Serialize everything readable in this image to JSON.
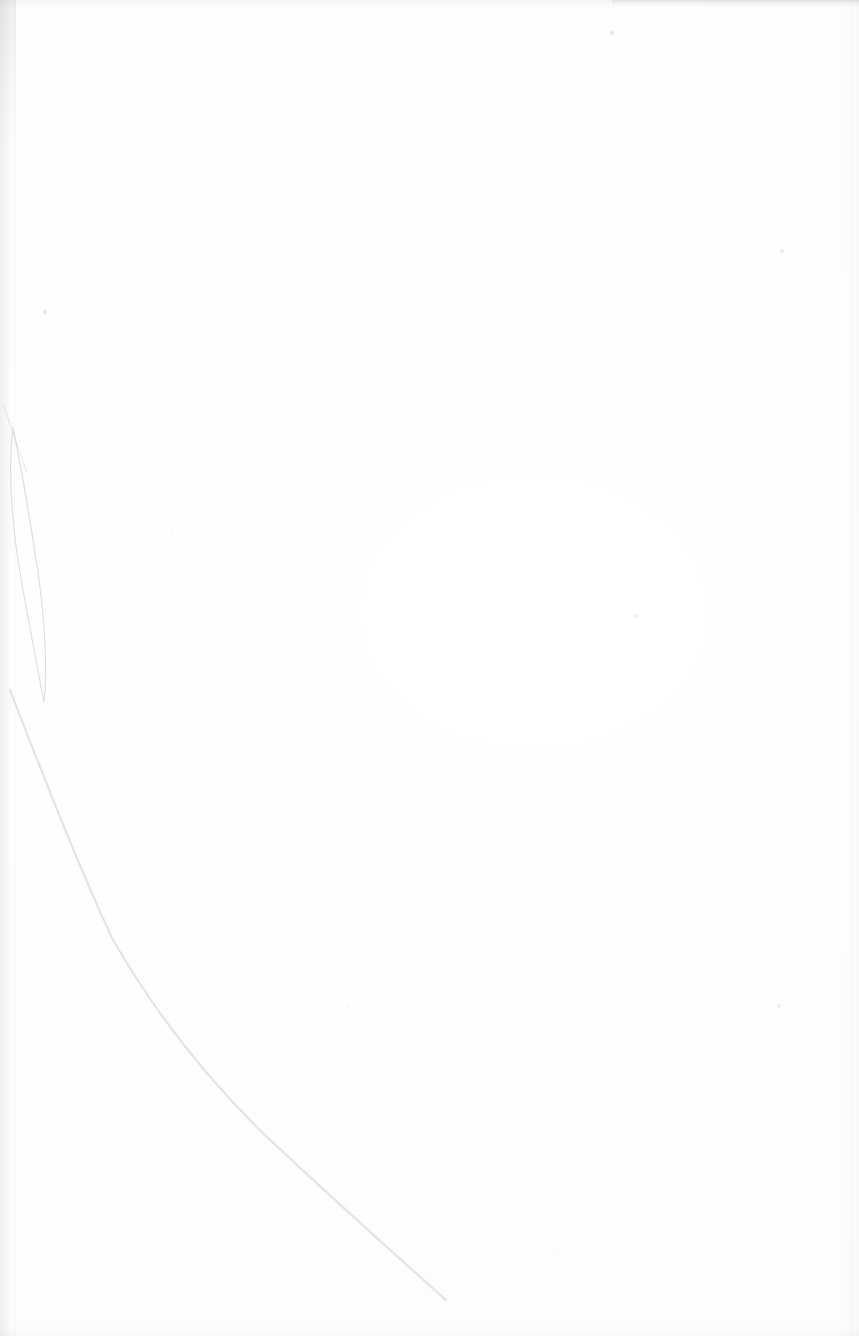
{
  "page": {
    "kind": "scanned-document-page",
    "orientation": "portrait",
    "width_px": 859,
    "height_px": 1336,
    "visible_text": "",
    "text_content_present": false,
    "paper_color": "#ffffff",
    "background_tone": "#fefefe",
    "ink_color": "#1a1a1a"
  },
  "artifacts": {
    "gutter_shadow": {
      "name": "left binding shadow",
      "x": 0,
      "y": 0,
      "width": 15,
      "height": 1336,
      "color": "#7c8086",
      "opacity": 0.115
    },
    "gutter_rule": {
      "name": "faint vertical rule beside gutter",
      "x": 14,
      "color": "#969aa0",
      "opacity": 0.065
    },
    "right_edge_line": {
      "name": "right page edge line",
      "x": 851,
      "color": "#a0a3a8",
      "opacity": 0.075
    },
    "top_edge_smudge": {
      "name": "top edge gray band",
      "y": 0,
      "height": 8,
      "strong_from_x": 612,
      "strong_to_x": 859,
      "color": "#80848a",
      "opacity": 0.135
    },
    "bottom_edge_smudge": {
      "name": "bottom edge gray band",
      "height": 14,
      "color": "#989ca2",
      "opacity": 0.06
    },
    "crease": {
      "name": "paper fold crease",
      "color": "#c9ccd2",
      "opacity": 0.55,
      "loop_path": "M 13 428 C 22 470, 30 520, 38 572 C 45 622, 48 664, 44 702 C 36 660, 26 610, 18 560 C 11 512, 8 468, 13 428 Z",
      "diagonal_path": "M 10 690 C 42 772, 74 856, 112 938 C 160 1022, 214 1086, 268 1138 C 330 1196, 392 1252, 446 1300",
      "upper_wisp_path": "M 4 406 C 10 424, 18 448, 27 472"
    },
    "specks": [
      {
        "x": 45,
        "y": 312,
        "r": 2.0,
        "opacity": 0.2
      },
      {
        "x": 612,
        "y": 33,
        "r": 2.2,
        "opacity": 0.17
      },
      {
        "x": 782,
        "y": 251,
        "r": 1.8,
        "opacity": 0.13
      },
      {
        "x": 636,
        "y": 616,
        "r": 1.6,
        "opacity": 0.12
      },
      {
        "x": 779,
        "y": 1006,
        "r": 1.7,
        "opacity": 0.12
      },
      {
        "x": 348,
        "y": 1007,
        "r": 1.4,
        "opacity": 0.1
      },
      {
        "x": 558,
        "y": 1254,
        "r": 1.4,
        "opacity": 0.1
      },
      {
        "x": 172,
        "y": 531,
        "r": 1.3,
        "opacity": 0.09
      }
    ]
  }
}
